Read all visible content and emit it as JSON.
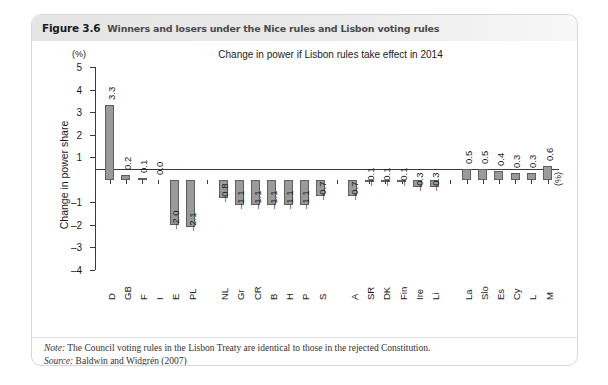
{
  "figure": {
    "number": "Figure 3.6",
    "caption": "Winners and losers under the Nice rules and Lisbon voting rules",
    "note_label": "Note:",
    "note_text": " The Council voting rules in the Lisbon Treaty are identical to those in the rejected Constitution.",
    "source_label": "Source:",
    "source_text": " Baldwin and Widgrén (2007)"
  },
  "chart_data": {
    "type": "bar",
    "title": "Change in power if Lisbon rules take effect in 2014",
    "xlabel": "",
    "ylabel": "Change in power share",
    "unit_top": "(%)",
    "unit_right": "(%)",
    "ylim": [
      -4,
      5
    ],
    "yticks": [
      5,
      4,
      3,
      2,
      1,
      -1,
      -2,
      -3,
      -4
    ],
    "ytick_labels": [
      "5",
      "4",
      "3",
      "2",
      "1",
      "–1",
      "–2",
      "–3",
      "–4"
    ],
    "grid": false,
    "legend": "none",
    "bar_color": "#9a9a9a",
    "bar_edge_color": "#5f5f5f",
    "categories": [
      "D",
      "GB",
      "F",
      "I",
      "E",
      "PL",
      "",
      "NL",
      "Gr",
      "CR",
      "B",
      "H",
      "P",
      "S",
      "",
      "A",
      "SR",
      "DK",
      "Fin",
      "Ire",
      "Li",
      "",
      "La",
      "Slo",
      "Es",
      "Cy",
      "L",
      "M"
    ],
    "values": [
      3.3,
      0.2,
      0.1,
      0.0,
      -2.0,
      -2.1,
      null,
      -0.8,
      -1.1,
      -1.1,
      -1.1,
      -1.1,
      -1.1,
      -0.7,
      null,
      -0.7,
      -0.1,
      -0.1,
      -0.1,
      -0.3,
      -0.3,
      null,
      0.5,
      0.5,
      0.4,
      0.3,
      0.3,
      0.6
    ],
    "value_labels": [
      "3.3",
      "0.2",
      "0.1",
      "0.0",
      "–2.0",
      "–2.1",
      "",
      "–0.8",
      "–1.1",
      "–1.1",
      "–1.1",
      "–1.1",
      "–1.1",
      "–0.7",
      "",
      "–0.7",
      "–0.1",
      "–0.1",
      "–0.1",
      "–0.3",
      "–0.3",
      "",
      "0.5",
      "0.5",
      "0.4",
      "0.3",
      "0.3",
      "0.6"
    ]
  }
}
